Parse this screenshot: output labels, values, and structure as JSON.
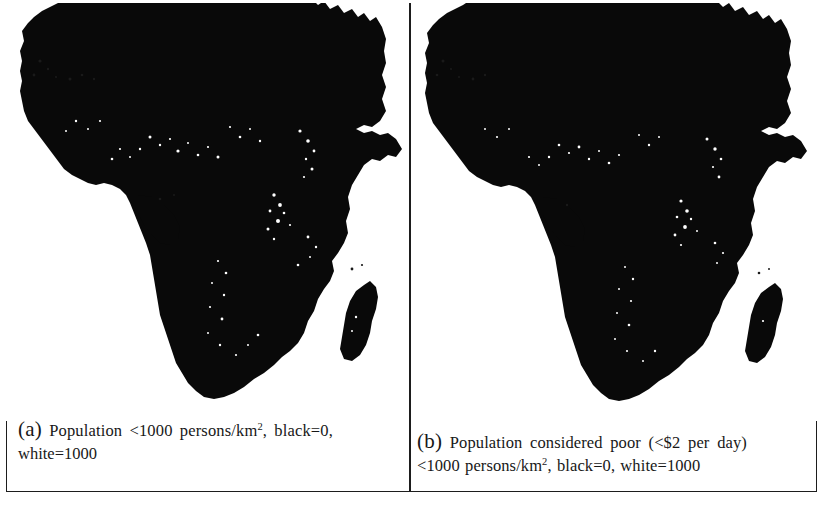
{
  "figure": {
    "type": "two-panel raster map figure",
    "background_color": "#ffffff",
    "frame_color": "#1d1d1d",
    "land_color": "#090909"
  },
  "panels": [
    {
      "id": "a",
      "label": "(a)",
      "map_subject": "Africa",
      "caption_line_1": "Population  <1000  persons/km",
      "caption_exponent": "2",
      "caption_line_1_tail": ", black=0,",
      "caption_line_2": "white=1000",
      "caption_full": "(a) Population <1000 persons/km2, black=0, white=1000"
    },
    {
      "id": "b",
      "label": "(b)",
      "map_subject": "Africa",
      "caption_line_1": "Population considered poor (<$2 per day)",
      "caption_line_2_head": "<1000 persons/km",
      "caption_exponent": "2",
      "caption_line_2_tail": ", black=0, white=1000",
      "caption_full": "(b) Population considered poor (<$2 per day) <1000 persons/km2, black=0, white=1000"
    }
  ],
  "legend": {
    "black_value": "black=0",
    "white_value": "white=1000",
    "units": "persons/km2",
    "threshold": "<1000"
  }
}
